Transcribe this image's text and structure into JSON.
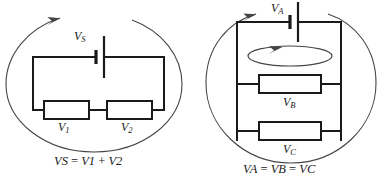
{
  "figure": {
    "background_color": "#ffffff",
    "wire_color": "#1a1a1a",
    "loop_color": "#454545",
    "diagrams": [
      {
        "id": "series-circuit",
        "kind": "series",
        "loop_shape": "ellipse",
        "loop_arrow": "clockwise-top-left",
        "source": {
          "symbol": "battery",
          "label_text": "V",
          "label_sub": "S"
        },
        "components": [
          {
            "type": "resistor",
            "label_text": "V",
            "label_sub": "1",
            "position": "bottom-left"
          },
          {
            "type": "resistor",
            "label_text": "V",
            "label_sub": "2",
            "position": "bottom-right"
          }
        ],
        "caption": {
          "terms": [
            "V",
            "S",
            "=",
            "V",
            "1",
            "+",
            "V",
            "2"
          ],
          "text": "VS = V1 + V2"
        }
      },
      {
        "id": "parallel-circuit",
        "kind": "parallel",
        "loop_shape": "circle",
        "loop_arrow": "clockwise-top-left",
        "inner_loop_arrow": "clockwise",
        "source": {
          "symbol": "battery",
          "label_text": "V",
          "label_sub": "A"
        },
        "components": [
          {
            "type": "resistor",
            "label_text": "V",
            "label_sub": "B",
            "position": "middle"
          },
          {
            "type": "resistor",
            "label_text": "V",
            "label_sub": "C",
            "position": "bottom"
          }
        ],
        "caption": {
          "terms": [
            "V",
            "A",
            "=",
            "V",
            "B",
            "=",
            "V",
            "C"
          ],
          "text": "VA = VB = VC"
        }
      }
    ]
  },
  "labels": {
    "v_s": {
      "base": "V",
      "sub": "S"
    },
    "v_1": {
      "base": "V",
      "sub": "1"
    },
    "v_2": {
      "base": "V",
      "sub": "2"
    },
    "v_a": {
      "base": "V",
      "sub": "A"
    },
    "v_b": {
      "base": "V",
      "sub": "B"
    },
    "v_c": {
      "base": "V",
      "sub": "C"
    }
  },
  "captions": {
    "left": {
      "t1": "V",
      "s1": "S",
      "eq": " = ",
      "t2": "V",
      "s2": "1",
      "plus": " + ",
      "t3": "V",
      "s3": "2"
    },
    "right": {
      "t1": "V",
      "s1": "A",
      "eq1": " = ",
      "t2": "V",
      "s2": "B",
      "eq2": " = ",
      "t3": "V",
      "s3": "C"
    }
  }
}
